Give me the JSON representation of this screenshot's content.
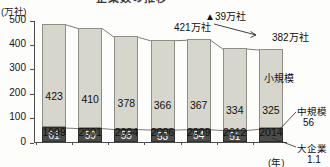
{
  "title": "企業数の推移",
  "unit_label": "(万社)",
  "year_unit": "(年)",
  "axis": {
    "y_ticks": [
      "0",
      "100",
      "200",
      "300",
      "400",
      "500"
    ],
    "y_values": [
      0,
      100,
      200,
      300,
      400,
      500
    ],
    "y_min": 0,
    "y_max": 500
  },
  "annotations": {
    "decrease": "▲39万社",
    "start_total": "421万社",
    "end_total": "382万社",
    "small_label": "小規模",
    "medium_label": "中規模",
    "medium_value": "56",
    "large_label": "大企業",
    "large_value": "1.1"
  },
  "chart_data": {
    "type": "bar",
    "title": "企業数の推移",
    "xlabel": "(年)",
    "ylabel": "(万社)",
    "ylim": [
      0,
      500
    ],
    "grid": false,
    "legend": "inline-annotation",
    "stacked": true,
    "categories": [
      "1999",
      "2001",
      "2004",
      "2006",
      "2009",
      "2012",
      "2014"
    ],
    "series": [
      {
        "name": "小規模",
        "values": [
          423,
          410,
          378,
          366,
          367,
          334,
          325
        ],
        "color": "#d6d6cc"
      },
      {
        "name": "中規模",
        "values": [
          61,
          59,
          55,
          53,
          54,
          51,
          56
        ],
        "color": "#4c4c49",
        "labels": [
          "61",
          "59",
          "55",
          "53",
          "54",
          "51",
          ""
        ]
      }
    ],
    "totals": [
      484,
      469,
      433,
      419,
      421,
      385,
      381
    ],
    "notes": [
      "421万社",
      "382万社",
      "▲39万社",
      "大企業 1.1"
    ]
  }
}
